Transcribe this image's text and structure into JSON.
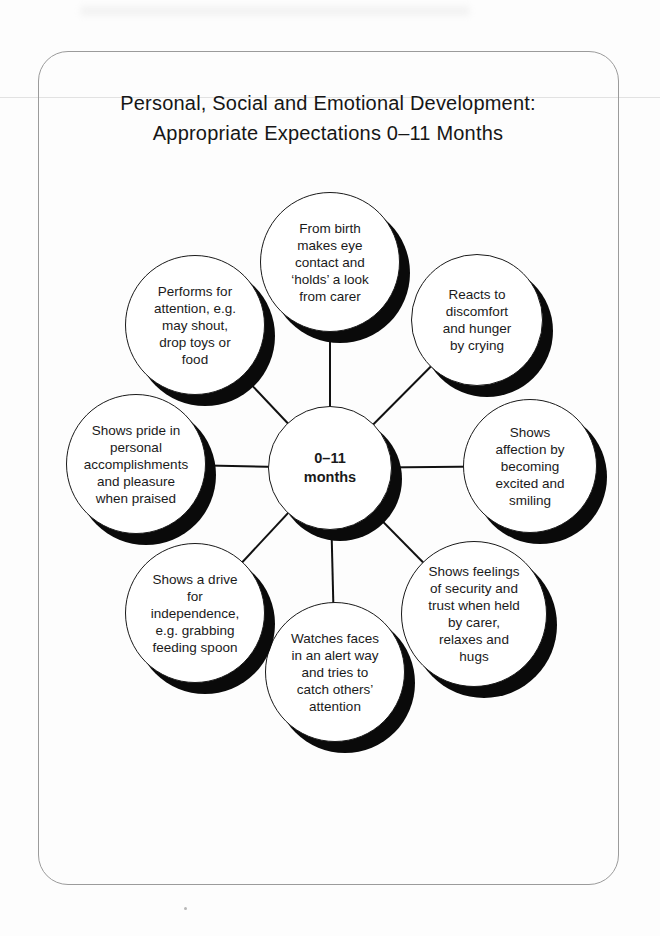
{
  "page": {
    "title": "Personal, Social and Emotional Development:\nAppropriate Expectations 0–11 Months"
  },
  "diagram": {
    "center_label": "0–11\nmonths",
    "nodes": [
      {
        "id": "top",
        "label": "From birth\nmakes eye\ncontact and\n‘holds’ a look\nfrom carer"
      },
      {
        "id": "top-right",
        "label": "Reacts to\ndiscomfort\nand hunger\nby crying"
      },
      {
        "id": "right",
        "label": "Shows\naffection by\nbecoming\nexcited and\nsmiling"
      },
      {
        "id": "bottom-right",
        "label": "Shows feelings\nof security and\ntrust when held\nby carer,\nrelaxes and\nhugs"
      },
      {
        "id": "bottom",
        "label": "Watches faces\nin an alert way\nand tries to\ncatch others’\nattention"
      },
      {
        "id": "bottom-left",
        "label": "Shows a drive\nfor\nindependence,\ne.g. grabbing\nfeeding spoon"
      },
      {
        "id": "left",
        "label": "Shows pride in\npersonal\naccomplishments\nand pleasure\nwhen praised"
      },
      {
        "id": "top-left",
        "label": "Performs for\nattention, e.g.\nmay shout,\ndrop toys or\nfood"
      }
    ]
  }
}
